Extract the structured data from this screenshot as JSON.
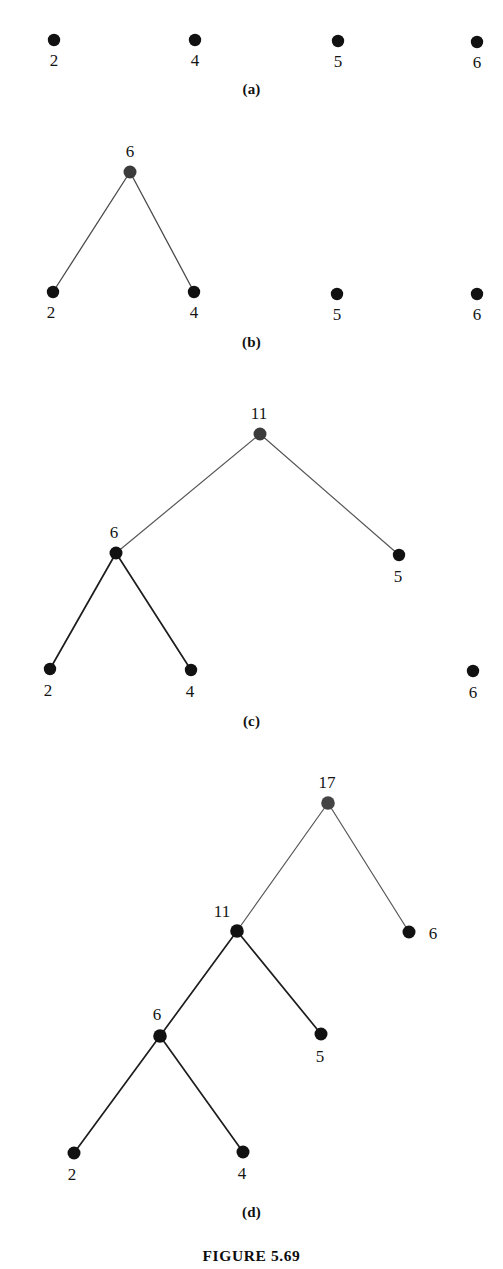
{
  "figure": {
    "caption": "FIGURE 5.69",
    "caption_y": 1247,
    "panels": [
      {
        "id": "a",
        "label": "(a)",
        "label_y": 81,
        "top": 0,
        "height": 110,
        "description": "four isolated single-node trees",
        "nodes": [
          {
            "name": "node-2",
            "value": "2",
            "x": 54,
            "y": 40,
            "r": 6.2,
            "color": "#111111",
            "label_x": 54,
            "label_y": 66,
            "label_anchor": "middle"
          },
          {
            "name": "node-4",
            "value": "4",
            "x": 195,
            "y": 40,
            "r": 6.2,
            "color": "#111111",
            "label_x": 195,
            "label_y": 66,
            "label_anchor": "middle"
          },
          {
            "name": "node-5",
            "value": "5",
            "x": 338,
            "y": 41,
            "r": 6.2,
            "color": "#111111",
            "label_x": 338,
            "label_y": 67,
            "label_anchor": "middle"
          },
          {
            "name": "node-6",
            "value": "6",
            "x": 477,
            "y": 42,
            "r": 6.2,
            "color": "#111111",
            "label_x": 477,
            "label_y": 68,
            "label_anchor": "middle"
          }
        ],
        "edges": []
      },
      {
        "id": "b",
        "label": "(b)",
        "label_y": 334,
        "top": 110,
        "height": 250,
        "description": "nodes 2 and 4 merged under new root 6; 5 and 6 still isolated",
        "nodes": [
          {
            "name": "node-6-root",
            "value": "6",
            "x": 130,
            "y": 172,
            "r": 6.5,
            "color": "#3b3b3b",
            "label_x": 130,
            "label_y": 157,
            "label_anchor": "middle"
          },
          {
            "name": "node-2",
            "value": "2",
            "x": 53,
            "y": 292,
            "r": 6.2,
            "color": "#111111",
            "label_x": 51,
            "label_y": 318,
            "label_anchor": "middle"
          },
          {
            "name": "node-4",
            "value": "4",
            "x": 194,
            "y": 292,
            "r": 6.2,
            "color": "#111111",
            "label_x": 194,
            "label_y": 318,
            "label_anchor": "middle"
          },
          {
            "name": "node-5",
            "value": "5",
            "x": 337,
            "y": 294,
            "r": 6.2,
            "color": "#111111",
            "label_x": 337,
            "label_y": 320,
            "label_anchor": "middle"
          },
          {
            "name": "node-6-isolated",
            "value": "6",
            "x": 477,
            "y": 294,
            "r": 6.2,
            "color": "#111111",
            "label_x": 477,
            "label_y": 320,
            "label_anchor": "middle"
          }
        ],
        "edges": [
          {
            "name": "edge-6-to-2",
            "x1": 130,
            "y1": 172,
            "x2": 53,
            "y2": 292,
            "width": 1.3,
            "color": "#4a4a4a"
          },
          {
            "name": "edge-6-to-4",
            "x1": 130,
            "y1": 172,
            "x2": 194,
            "y2": 292,
            "width": 1.3,
            "color": "#4a4a4a"
          }
        ]
      },
      {
        "id": "c",
        "label": "(c)",
        "label_y": 713,
        "top": 360,
        "height": 375,
        "description": "subtree rooted at 6 merged with leaf 5 under new root 11; 6 still isolated",
        "nodes": [
          {
            "name": "node-11-root",
            "value": "11",
            "x": 260,
            "y": 434,
            "r": 6.5,
            "color": "#3b3b3b",
            "label_x": 259,
            "label_y": 419,
            "label_anchor": "middle"
          },
          {
            "name": "node-6",
            "value": "6",
            "x": 116,
            "y": 553,
            "r": 6.5,
            "color": "#111111",
            "label_x": 114,
            "label_y": 538,
            "label_anchor": "middle"
          },
          {
            "name": "node-5",
            "value": "5",
            "x": 399,
            "y": 555,
            "r": 6.2,
            "color": "#111111",
            "label_x": 398,
            "label_y": 582,
            "label_anchor": "middle"
          },
          {
            "name": "node-2",
            "value": "2",
            "x": 50,
            "y": 669,
            "r": 6.2,
            "color": "#111111",
            "label_x": 48,
            "label_y": 696,
            "label_anchor": "middle"
          },
          {
            "name": "node-4",
            "value": "4",
            "x": 191,
            "y": 670,
            "r": 6.2,
            "color": "#111111",
            "label_x": 190,
            "label_y": 697,
            "label_anchor": "middle"
          },
          {
            "name": "node-6-isolated",
            "value": "6",
            "x": 473,
            "y": 671,
            "r": 6.2,
            "color": "#111111",
            "label_x": 473,
            "label_y": 698,
            "label_anchor": "middle"
          }
        ],
        "edges": [
          {
            "name": "edge-11-to-6",
            "x1": 260,
            "y1": 434,
            "x2": 116,
            "y2": 553,
            "width": 1.2,
            "color": "#575757"
          },
          {
            "name": "edge-11-to-5",
            "x1": 260,
            "y1": 434,
            "x2": 399,
            "y2": 555,
            "width": 1.2,
            "color": "#575757"
          },
          {
            "name": "edge-6-to-2",
            "x1": 116,
            "y1": 553,
            "x2": 50,
            "y2": 669,
            "width": 1.7,
            "color": "#1d1d1d"
          },
          {
            "name": "edge-6-to-4",
            "x1": 116,
            "y1": 553,
            "x2": 191,
            "y2": 670,
            "width": 1.7,
            "color": "#1d1d1d"
          }
        ]
      },
      {
        "id": "d",
        "label": "(d)",
        "label_y": 1204,
        "top": 735,
        "height": 485,
        "description": "subtree rooted at 11 merged with leaf 6 under new root 17; full Huffman tree",
        "nodes": [
          {
            "name": "node-17-root",
            "value": "17",
            "x": 328,
            "y": 803,
            "r": 6.8,
            "color": "#444444",
            "label_x": 327,
            "label_y": 788,
            "label_anchor": "middle"
          },
          {
            "name": "node-11",
            "value": "11",
            "x": 237,
            "y": 931,
            "r": 6.8,
            "color": "#111111",
            "label_x": 222,
            "label_y": 917,
            "label_anchor": "middle"
          },
          {
            "name": "node-6-right",
            "value": "6",
            "x": 409,
            "y": 932,
            "r": 6.5,
            "color": "#111111",
            "label_x": 433,
            "label_y": 939,
            "label_anchor": "middle"
          },
          {
            "name": "node-6-left",
            "value": "6",
            "x": 160,
            "y": 1036,
            "r": 6.8,
            "color": "#111111",
            "label_x": 157,
            "label_y": 1020,
            "label_anchor": "middle"
          },
          {
            "name": "node-5",
            "value": "5",
            "x": 321,
            "y": 1034,
            "r": 6.5,
            "color": "#111111",
            "label_x": 320,
            "label_y": 1062,
            "label_anchor": "middle"
          },
          {
            "name": "node-2",
            "value": "2",
            "x": 74,
            "y": 1153,
            "r": 6.5,
            "color": "#111111",
            "label_x": 72,
            "label_y": 1180,
            "label_anchor": "middle"
          },
          {
            "name": "node-4",
            "value": "4",
            "x": 243,
            "y": 1152,
            "r": 6.5,
            "color": "#111111",
            "label_x": 242,
            "label_y": 1179,
            "label_anchor": "middle"
          }
        ],
        "edges": [
          {
            "name": "edge-17-to-11",
            "x1": 328,
            "y1": 803,
            "x2": 237,
            "y2": 931,
            "width": 1.2,
            "color": "#565656"
          },
          {
            "name": "edge-17-to-6",
            "x1": 328,
            "y1": 803,
            "x2": 409,
            "y2": 932,
            "width": 1.2,
            "color": "#565656"
          },
          {
            "name": "edge-11-to-6",
            "x1": 237,
            "y1": 931,
            "x2": 160,
            "y2": 1036,
            "width": 1.7,
            "color": "#1d1d1d"
          },
          {
            "name": "edge-11-to-5",
            "x1": 237,
            "y1": 931,
            "x2": 321,
            "y2": 1034,
            "width": 1.7,
            "color": "#1d1d1d"
          },
          {
            "name": "edge-6-to-2",
            "x1": 160,
            "y1": 1036,
            "x2": 74,
            "y2": 1153,
            "width": 1.7,
            "color": "#1d1d1d"
          },
          {
            "name": "edge-6-to-4",
            "x1": 160,
            "y1": 1036,
            "x2": 243,
            "y2": 1152,
            "width": 1.7,
            "color": "#1d1d1d"
          }
        ]
      }
    ]
  }
}
